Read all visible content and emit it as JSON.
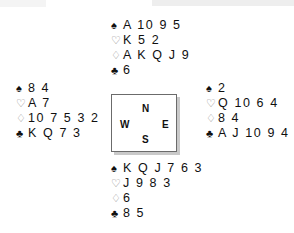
{
  "diagram": {
    "suit_symbols": {
      "spade": "♠",
      "heart": "♡",
      "diamond": "♢",
      "club": "♣"
    },
    "compass": {
      "north": "N",
      "south": "S",
      "west": "W",
      "east": "E"
    },
    "hands": {
      "north": {
        "label": "North",
        "spades": "A 10 9 5",
        "hearts": "K 5 2",
        "diamonds": "A K Q J 9",
        "clubs": "6"
      },
      "west": {
        "label": "West",
        "spades": "8 4",
        "hearts": "A 7",
        "diamonds": "10 7 5 3 2",
        "clubs": "K Q 7 3"
      },
      "east": {
        "label": "East",
        "spades": "2",
        "hearts": "Q 10 6 4",
        "diamonds": "8 4",
        "clubs": "A J 10 9 4 2"
      },
      "south": {
        "label": "South",
        "spades": "K Q J 7 6 3",
        "hearts": "J 9 8 3",
        "diamonds": "6",
        "clubs": "8 5"
      }
    },
    "colors": {
      "ink": "#101010",
      "outline_suit": "#8a8a8a",
      "box_border": "#6b6b6b",
      "box_shadow": "#c9c9c9",
      "background": "#ffffff"
    }
  }
}
